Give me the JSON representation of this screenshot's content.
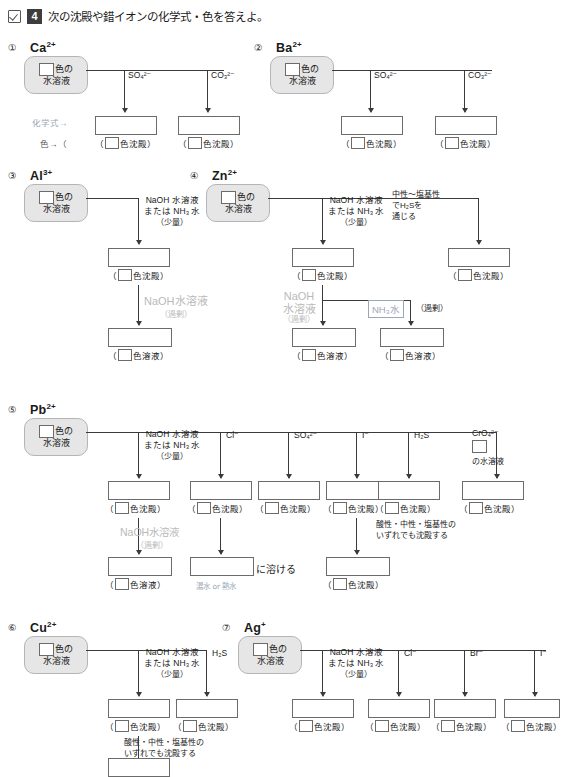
{
  "header": {
    "checkbox_icon": "checkmark-icon",
    "number": "4",
    "title": "次の沈殿や錯イオンの化学式・色を答えよ。"
  },
  "common": {
    "color_of": "色の",
    "aqueous": "水溶液",
    "precipitate_label": "色沈殿）",
    "solution_label": "色溶液）",
    "paren_open": "（",
    "naoh_line1": "NaOH 水溶液",
    "naoh_line2": "または NH₃ 水",
    "naoh_line3": "（少量）",
    "excess": "（過剰）",
    "naoh_excess_gray": "NaOH水溶液",
    "nh3_water": "NH₃水",
    "dissolves": "に溶ける",
    "acid_note1": "酸性・中性・塩基性の",
    "acid_note2": "いずれでも沈殿する"
  },
  "items": [
    {
      "num": "①",
      "ion": "Ca",
      "charge": "2+",
      "branches": [
        "SO₄²⁻",
        "CO₃²⁻"
      ],
      "side_notes": {
        "formula_hint": "化学式→",
        "color_hint": "色→（"
      }
    },
    {
      "num": "②",
      "ion": "Ba",
      "charge": "2+",
      "branches": [
        "SO₄²⁻",
        "CO₃²⁻"
      ]
    },
    {
      "num": "③",
      "ion": "Al",
      "charge": "3+",
      "branches": [
        "NaOH水溶液/NH₃水（少量）"
      ]
    },
    {
      "num": "④",
      "ion": "Zn",
      "charge": "2+",
      "branches": [
        "NaOH水溶液/NH₃水（少量）",
        "H₂S"
      ],
      "note": [
        "中性〜塩基性",
        "でH₂Sを",
        "通じる"
      ],
      "gray_naoh": [
        "NaOH",
        "水溶液",
        "（過剰）"
      ]
    },
    {
      "num": "⑤",
      "ion": "Pb",
      "charge": "2+",
      "branches": [
        "NaOH水溶液/NH₃水（少量）",
        "Cl⁻",
        "SO₄²⁻",
        "I⁻",
        "H₂S",
        "CrO₄²⁻"
      ],
      "cro4_box": "の水溶液",
      "pencil_note": "湯水 or 熱水"
    },
    {
      "num": "⑥",
      "ion": "Cu",
      "charge": "2+",
      "branches": [
        "NaOH水溶液/NH₃水（少量）",
        "H₂S"
      ]
    },
    {
      "num": "⑦",
      "ion": "Ag",
      "charge": "+",
      "branches": [
        "NaOH水溶液/NH₃水（少量）",
        "Cl⁻",
        "Br⁻",
        "I⁻"
      ]
    }
  ],
  "reagents": {
    "so4": "SO₄²⁻",
    "co3": "CO₃²⁻",
    "cl": "Cl⁻",
    "i": "I⁻",
    "br": "Br⁻",
    "h2s": "H₂S",
    "cro4": "CrO₄²⁻"
  },
  "colors": {
    "box_border": "#6b6b6b",
    "src_fill": "#e6e6e6",
    "line": "#3a3a3a",
    "gray_text": "#b9b9b9",
    "pencil": "#9aa7b4"
  }
}
